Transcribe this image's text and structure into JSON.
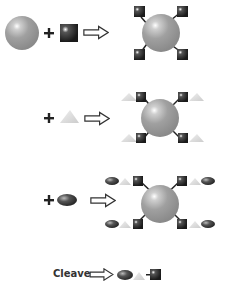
{
  "colors": {
    "bead": "#9a9a9a",
    "bead_highlight": "#f2f2f2",
    "linker": "#2a2a2a",
    "triangle": "#d9d9d9",
    "oval": "#555555",
    "arrow_stroke": "#333333",
    "plus": "#222222"
  },
  "steps": [
    {
      "id": "step1",
      "operator": "+",
      "reagent": "linker-square",
      "product": "bead-with-4-linkers"
    },
    {
      "id": "step2",
      "operator": "+",
      "reagent": "triangle-unit",
      "product": "bead-with-4-linker-triangle"
    },
    {
      "id": "step3",
      "operator": "+",
      "reagent": "oval-unit",
      "product": "bead-with-4-linker-triangle-oval"
    }
  ],
  "cleave": {
    "label": "Cleave",
    "product": "oval-triangle-linker"
  }
}
